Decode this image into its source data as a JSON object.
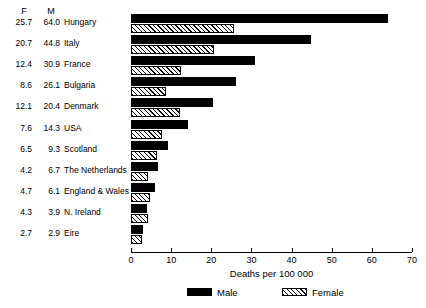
{
  "chart_data": {
    "type": "bar",
    "orientation": "horizontal",
    "title": "",
    "xlabel": "Deaths per 100 000",
    "ylabel": "",
    "xlim": [
      0,
      70
    ],
    "xticks": [
      0,
      10,
      20,
      30,
      40,
      50,
      60,
      70
    ],
    "grid": false,
    "legend_position": "bottom",
    "legend": [
      "Male",
      "Female"
    ],
    "categories": [
      "Hungary",
      "Italy",
      "France",
      "Bulgaria",
      "Denmark",
      "USA",
      "Scotland",
      "The Netherlands",
      "England & Wales",
      "N. Ireland",
      "Eire"
    ],
    "series": [
      {
        "name": "Male",
        "values": [
          64.0,
          44.8,
          30.9,
          26.1,
          20.4,
          14.3,
          9.3,
          6.7,
          6.1,
          3.9,
          2.9
        ]
      },
      {
        "name": "Female",
        "values": [
          25.7,
          20.7,
          12.4,
          8.6,
          12.1,
          7.6,
          6.5,
          4.2,
          4.7,
          4.3,
          2.7
        ]
      }
    ]
  },
  "table": {
    "header_female": "F",
    "header_male": "M",
    "rows": [
      {
        "f": "25.7",
        "m": "64.0",
        "name": "Hungary"
      },
      {
        "f": "20.7",
        "m": "44.8",
        "name": "Italy"
      },
      {
        "f": "12.4",
        "m": "30.9",
        "name": "France"
      },
      {
        "f": "8.6",
        "m": "26.1",
        "name": "Bulgaria"
      },
      {
        "f": "12.1",
        "m": "20.4",
        "name": "Denmark"
      },
      {
        "f": "7.6",
        "m": "14.3",
        "name": "USA"
      },
      {
        "f": "6.5",
        "m": "9.3",
        "name": "Scotland"
      },
      {
        "f": "4.2",
        "m": "6.7",
        "name": "The Netherlands"
      },
      {
        "f": "4.7",
        "m": "6.1",
        "name": "England & Wales"
      },
      {
        "f": "4.3",
        "m": "3.9",
        "name": "N. Ireland"
      },
      {
        "f": "2.7",
        "m": "2.9",
        "name": "Eire"
      }
    ]
  },
  "axis": {
    "title": "Deaths per 100 000",
    "tick_labels": [
      "0",
      "10",
      "20",
      "30",
      "40",
      "50",
      "60",
      "70"
    ]
  },
  "legend": {
    "male_label": "Male",
    "female_label": "Female"
  },
  "colors": {
    "male": "#000000",
    "female_fill": "#ffffff",
    "female_hatch": "#000000",
    "axis": "#000000",
    "background": "#ffffff"
  }
}
